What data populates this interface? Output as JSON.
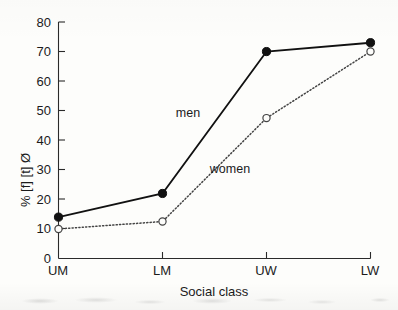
{
  "chart_data": {
    "type": "line",
    "title": "",
    "xlabel": "Social class",
    "ylabel": "% [f] [t] Ø",
    "categories": [
      "UM",
      "LM",
      "UW",
      "LW"
    ],
    "ylim": [
      0,
      80
    ],
    "yticks": [
      0,
      10,
      20,
      30,
      40,
      50,
      60,
      70,
      80
    ],
    "ytick_labels": [
      "0",
      "10",
      "20",
      "30",
      "40",
      "50",
      "60",
      "70",
      "80"
    ],
    "grid": false,
    "legend_position": "inline-annotation",
    "series": [
      {
        "name": "men",
        "values": [
          14,
          22,
          70,
          73
        ],
        "marker": "filled-circle",
        "line_style": "solid",
        "color": "#111111"
      },
      {
        "name": "women",
        "values": [
          10,
          12.5,
          47.5,
          70
        ],
        "marker": "open-circle",
        "line_style": "dotted",
        "color": "#444444"
      }
    ],
    "annotations": [
      {
        "text": "men",
        "x_px": 188,
        "y_px": 117
      },
      {
        "text": "women",
        "x_px": 230,
        "y_px": 173
      }
    ]
  },
  "figure": {
    "axis_color": "#2a2a2a",
    "background": "#fdfdfb",
    "x_axis_label": "Social class",
    "y_axis_label": "% [f] [t] Ø"
  }
}
